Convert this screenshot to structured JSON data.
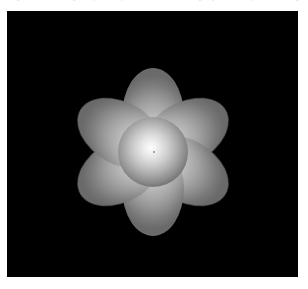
{
  "page": {
    "background_color": "#ffffff",
    "width": 308,
    "height": 289
  },
  "caption_strip": {
    "clipped_text": "Figure rendering output — procedural flower, grayscale depth shading",
    "text_color": "#d8d8d8",
    "note": "only the bottom sliver of this text line is visible at the top of the frame"
  },
  "image_canvas": {
    "name": "rendered-image",
    "background_color": "#000000",
    "left": 7,
    "top": 11,
    "width": 291,
    "height": 266
  },
  "chart_data": {
    "type": "scatter",
    "xlabel": "",
    "ylabel": "",
    "background_color": "#000000",
    "center": {
      "x": 153,
      "y": 152
    },
    "bounds": {
      "left": 88,
      "top": 87,
      "right": 218,
      "bottom": 212
    },
    "petal_count": 6,
    "petal_rotation_offset_deg": 0,
    "core": {
      "radius": 35,
      "highlight_color": "#fdfdfd",
      "edge_color": "#3a3a3a",
      "highlight_offset": {
        "x": -2,
        "y": -3
      }
    },
    "petal_gradient": {
      "inner_color": "#e8e8e8",
      "outer_color": "#6a6a6a"
    },
    "petals": [
      {
        "index": 0,
        "angle_deg": 0,
        "label": "top"
      },
      {
        "index": 1,
        "angle_deg": 60,
        "label": "upper-right"
      },
      {
        "index": 2,
        "angle_deg": 120,
        "label": "lower-right"
      },
      {
        "index": 3,
        "angle_deg": 180,
        "label": "bottom"
      },
      {
        "index": 4,
        "angle_deg": 240,
        "label": "lower-left"
      },
      {
        "index": 5,
        "angle_deg": 300,
        "label": "upper-left"
      }
    ]
  }
}
